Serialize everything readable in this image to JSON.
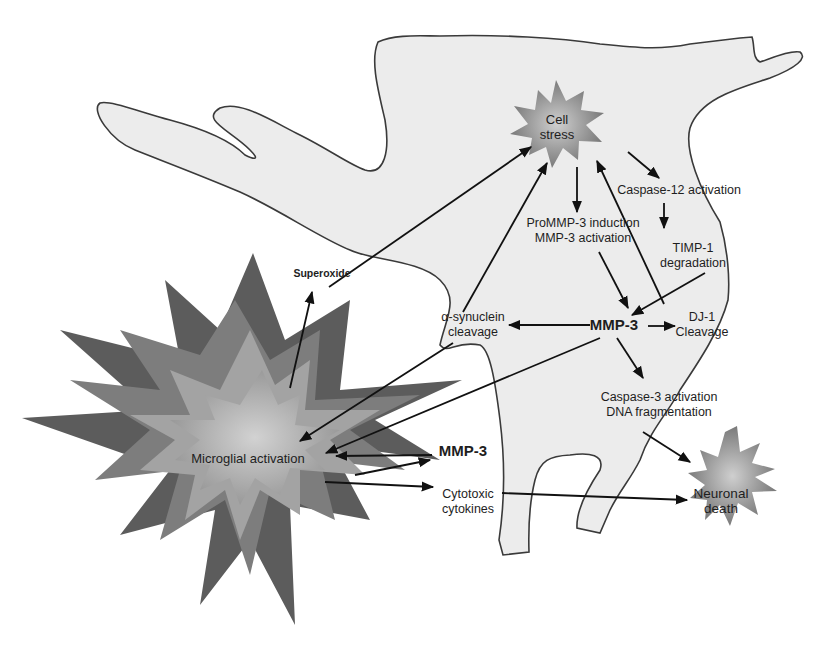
{
  "diagram": {
    "nodes": {
      "cell_stress": {
        "line1": "Cell",
        "line2": "stress"
      },
      "caspase12": {
        "line1": "Caspase-12 activation"
      },
      "prommp3": {
        "line1": "ProMMP-3 induction",
        "line2": "MMP-3 activation"
      },
      "timp1": {
        "line1": "TIMP-1",
        "line2": "degradation"
      },
      "superoxide": {
        "line1": "Superoxide"
      },
      "asyn": {
        "line1": "α-synuclein",
        "line2": "cleavage"
      },
      "mmp3_center": {
        "line1": "MMP-3"
      },
      "dj1": {
        "line1": "DJ-1",
        "line2": "Cleavage"
      },
      "caspase3": {
        "line1": "Caspase-3 activation",
        "line2": "DNA fragmentation"
      },
      "microglia": {
        "line1": "Microglial activation"
      },
      "mmp3_micro": {
        "line1": "MMP-3"
      },
      "cytokines": {
        "line1": "Cytotoxic",
        "line2": "cytokines"
      },
      "neuronal_death": {
        "line1": "Neuronal",
        "line2": "death"
      }
    },
    "edges": [
      {
        "from": "cell_stress",
        "to": "prommp3"
      },
      {
        "from": "cell_stress",
        "to": "caspase12"
      },
      {
        "from": "caspase12",
        "to": "timp1"
      },
      {
        "from": "prommp3",
        "to": "mmp3_center"
      },
      {
        "from": "timp1",
        "to": "mmp3_center"
      },
      {
        "from": "mmp3_center",
        "to": "asyn"
      },
      {
        "from": "mmp3_center",
        "to": "dj1"
      },
      {
        "from": "mmp3_center",
        "to": "caspase3"
      },
      {
        "from": "mmp3_center",
        "to": "microglia"
      },
      {
        "from": "asyn",
        "to": "cell_stress"
      },
      {
        "from": "asyn",
        "to": "microglia"
      },
      {
        "from": "dj1",
        "to": "cell_stress"
      },
      {
        "from": "superoxide",
        "to": "cell_stress"
      },
      {
        "from": "microglia",
        "to": "superoxide"
      },
      {
        "from": "mmp3_micro",
        "to": "microglia"
      },
      {
        "from": "microglia",
        "to": "mmp3_micro"
      },
      {
        "from": "microglia",
        "to": "cytokines"
      },
      {
        "from": "cytokines",
        "to": "neuronal_death"
      },
      {
        "from": "caspase3",
        "to": "neuronal_death"
      }
    ],
    "colors": {
      "cell_fill": "#ececec",
      "cell_outline": "#3a3a3a",
      "star_dark": "#5a5a5a",
      "star_mid": "#7e7e7e",
      "star_light": "#a8a8a8",
      "star_center": "#c4c4c4",
      "arrow": "#111111",
      "text": "#1e1e1e"
    }
  }
}
